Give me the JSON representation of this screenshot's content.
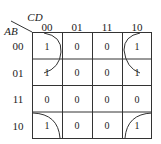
{
  "kmap": {
    "col_var": "CD",
    "row_var": "AB",
    "col_labels": [
      "00",
      "01",
      "11",
      "10"
    ],
    "row_labels": [
      "00",
      "01",
      "11",
      "10"
    ],
    "cells": [
      [
        "1",
        "0",
        "0",
        "1"
      ],
      [
        "1",
        "0",
        "0",
        "1"
      ],
      [
        "0",
        "0",
        "0",
        "0"
      ],
      [
        "1",
        "0",
        "0",
        "1"
      ]
    ]
  }
}
